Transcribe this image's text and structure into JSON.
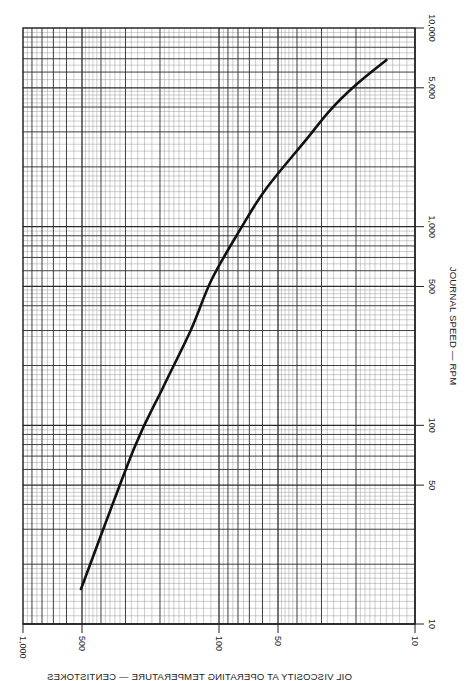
{
  "chart_data": {
    "type": "line",
    "orientation": "rotated-90",
    "x_axis": {
      "label": "OIL VISCOSITY AT OPERATING TEMPERATURE — CENTISTOKES",
      "scale": "log",
      "reversed": true,
      "range": [
        1000,
        10
      ],
      "ticks": [
        {
          "value": 1000,
          "label": "1,000"
        },
        {
          "value": 500,
          "label": "500"
        },
        {
          "value": 100,
          "label": "100"
        },
        {
          "value": 50,
          "label": "50"
        },
        {
          "value": 10,
          "label": "10"
        }
      ]
    },
    "y_axis": {
      "label": "JOURNAL SPEED — RPM",
      "scale": "log",
      "position": "right",
      "range": [
        10,
        10000
      ],
      "ticks": [
        {
          "value": 10,
          "label": "10"
        },
        {
          "value": 50,
          "label": "50"
        },
        {
          "value": 100,
          "label": "100"
        },
        {
          "value": 500,
          "label": "500"
        },
        {
          "value": 1000,
          "label": "1,000"
        },
        {
          "value": 5000,
          "label": "5,000"
        },
        {
          "value": 10000,
          "label": "10,000"
        }
      ]
    },
    "grid": true,
    "series": [
      {
        "name": "viscosity vs journal speed",
        "color": "#111111",
        "points": [
          {
            "viscosity": 506,
            "rpm": 15
          },
          {
            "viscosity": 272,
            "rpm": 76
          },
          {
            "viscosity": 195,
            "rpm": 152
          },
          {
            "viscosity": 139,
            "rpm": 303
          },
          {
            "viscosity": 109,
            "rpm": 542
          },
          {
            "viscosity": 78,
            "rpm": 966
          },
          {
            "viscosity": 58,
            "rpm": 1535
          },
          {
            "viscosity": 36,
            "rpm": 2735
          },
          {
            "viscosity": 27,
            "rpm": 3870
          },
          {
            "viscosity": 20,
            "rpm": 5180
          },
          {
            "viscosity": 14,
            "rpm": 6900
          }
        ]
      }
    ]
  },
  "layout": {
    "plot": {
      "left": 23,
      "top": 28,
      "right": 415,
      "bottom": 624
    },
    "colors": {
      "grid_major": "#2a2a2a",
      "grid_minor": "#9a9a9a",
      "curve": "#111111",
      "frame": "#1a1a1a"
    }
  }
}
